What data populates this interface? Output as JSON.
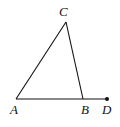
{
  "diagram": {
    "type": "triangle-with-extended-side",
    "points": {
      "A": {
        "label": "A",
        "x": 16,
        "y": 99
      },
      "B": {
        "label": "B",
        "x": 83,
        "y": 99
      },
      "C": {
        "label": "C",
        "x": 66,
        "y": 22
      },
      "D": {
        "label": "D",
        "x": 107,
        "y": 99
      }
    },
    "segments": [
      [
        "A",
        "C"
      ],
      [
        "C",
        "B"
      ],
      [
        "A",
        "D"
      ]
    ],
    "stroke_color": "#111111"
  }
}
